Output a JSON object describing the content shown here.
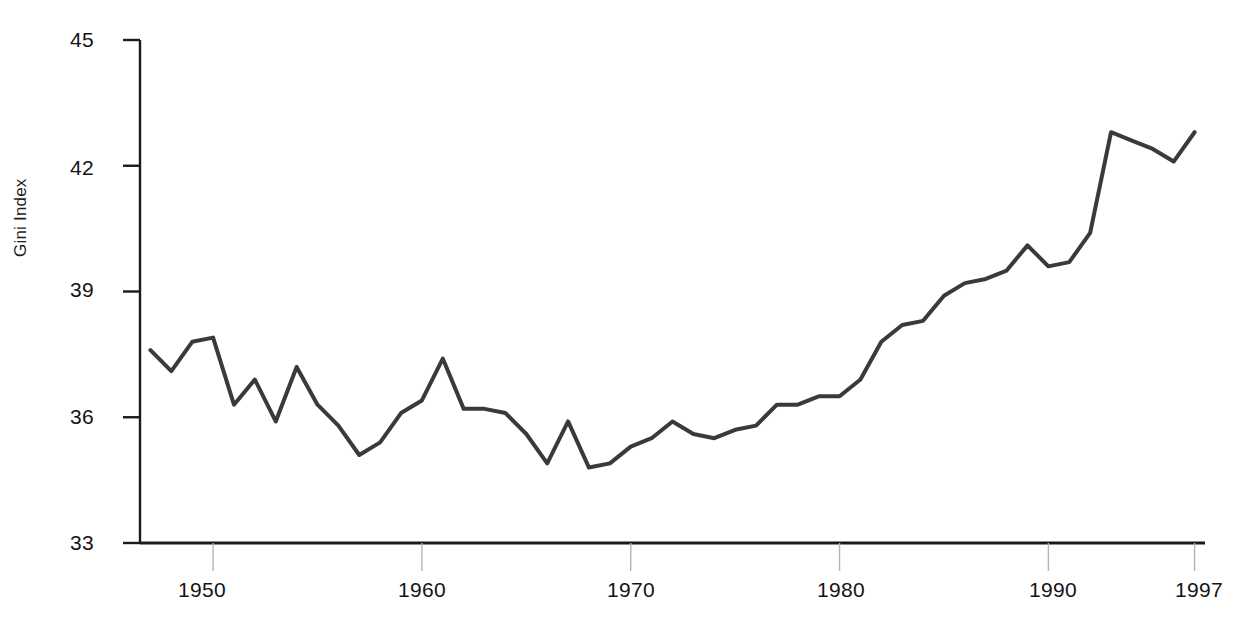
{
  "chart_data": {
    "type": "line",
    "title": "",
    "subtitle": "",
    "xlabel": "",
    "ylabel": "Gini Index",
    "xlim": [
      1946.5,
      1997.5
    ],
    "ylim": [
      33,
      45
    ],
    "grid": false,
    "legend": null,
    "line_color": "#3a3a3a",
    "line_width": 4,
    "x_ticks": [
      1950,
      1960,
      1970,
      1980,
      1990,
      1997
    ],
    "x_tick_labels": [
      "1950",
      "1960",
      "1970",
      "1980",
      "1990",
      "1997"
    ],
    "y_ticks": [
      33,
      36,
      39,
      42,
      45
    ],
    "y_tick_labels": [
      "33",
      "36",
      "39",
      "42",
      "45"
    ],
    "x": [
      1947,
      1948,
      1949,
      1950,
      1951,
      1952,
      1953,
      1954,
      1955,
      1956,
      1957,
      1958,
      1959,
      1960,
      1961,
      1962,
      1963,
      1964,
      1965,
      1966,
      1967,
      1968,
      1969,
      1970,
      1971,
      1972,
      1973,
      1974,
      1975,
      1976,
      1977,
      1978,
      1979,
      1980,
      1981,
      1982,
      1983,
      1984,
      1985,
      1986,
      1987,
      1988,
      1989,
      1990,
      1991,
      1992,
      1993,
      1994,
      1995,
      1996,
      1997
    ],
    "values": [
      37.6,
      37.1,
      37.8,
      37.9,
      36.3,
      36.9,
      35.9,
      37.2,
      36.3,
      35.8,
      35.1,
      35.4,
      36.1,
      36.4,
      37.4,
      36.2,
      36.2,
      36.1,
      35.6,
      34.9,
      35.9,
      34.8,
      34.9,
      35.3,
      35.5,
      35.9,
      35.6,
      35.5,
      35.7,
      35.8,
      36.3,
      36.3,
      36.5,
      36.5,
      36.9,
      37.8,
      38.2,
      38.3,
      38.9,
      39.2,
      39.3,
      39.5,
      40.1,
      39.6,
      39.7,
      40.4,
      42.8,
      42.6,
      42.4,
      42.1,
      42.8
    ]
  },
  "axis": {
    "y_label": "Gini Index",
    "y_ticks": [
      "45",
      "42",
      "39",
      "36",
      "33"
    ],
    "x_ticks": [
      "1950",
      "1960",
      "1970",
      "1980",
      "1990",
      "1997"
    ]
  }
}
